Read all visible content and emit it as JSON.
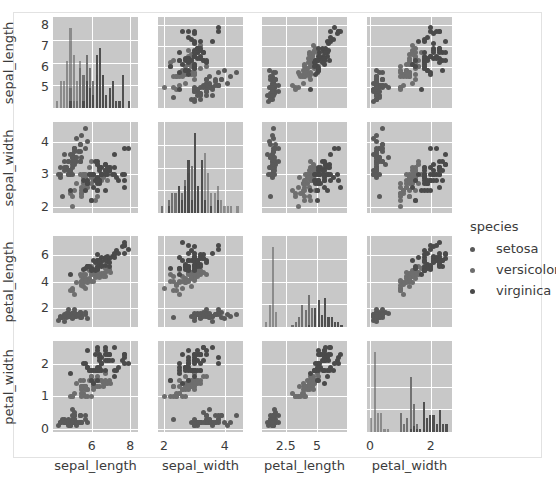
{
  "figure": {
    "title": "",
    "background": "#ffffff",
    "frame_color": "#e2e2e2",
    "panel_background": "#c8c8c8",
    "gridline_color": "#ffffff"
  },
  "legend": {
    "title": "species",
    "position": "right",
    "entries": [
      {
        "label": "setosa",
        "color": "#5a5a5a"
      },
      {
        "label": "versicolor",
        "color": "#6e6e6e"
      },
      {
        "label": "virginica",
        "color": "#4a4a4a"
      }
    ]
  },
  "chart_data": {
    "type": "scatter",
    "title": "",
    "subtitle": "",
    "plot_kind": "pairplot-matrix",
    "grid": true,
    "legend_position": "right",
    "variables": [
      "sepal_length",
      "sepal_width",
      "petal_length",
      "petal_width"
    ],
    "axis_labels": {
      "x": [
        "sepal_length",
        "sepal_width",
        "petal_length",
        "petal_width"
      ],
      "y": [
        "sepal_length",
        "sepal_width",
        "petal_length",
        "petal_width"
      ]
    },
    "ticks": {
      "sepal_length": {
        "values": [
          6,
          8
        ],
        "y_values": [
          5,
          6,
          7,
          8
        ],
        "lim": [
          4.0,
          8.4
        ]
      },
      "sepal_width": {
        "values": [
          2,
          4
        ],
        "y_values": [
          2,
          3,
          4
        ],
        "lim": [
          1.8,
          4.6
        ]
      },
      "petal_length": {
        "values": [
          2.5,
          5.0
        ],
        "y_values": [
          2,
          4,
          6
        ],
        "lim": [
          0.6,
          7.4
        ]
      },
      "petal_width": {
        "values": [
          0,
          2
        ],
        "y_values": [
          0,
          1,
          2
        ],
        "lim": [
          -0.1,
          2.7
        ]
      }
    },
    "diagonal": "histogram",
    "groups": [
      "setosa",
      "versicolor",
      "virginica"
    ],
    "group_colors": [
      "#5a5a5a",
      "#6e6e6e",
      "#4a4a4a"
    ],
    "series": [
      {
        "name": "setosa",
        "color": "#5a5a5a",
        "sepal_length": [
          5.1,
          4.9,
          4.7,
          4.6,
          5.0,
          5.4,
          4.6,
          5.0,
          4.4,
          4.9,
          5.4,
          4.8,
          4.8,
          4.3,
          5.8,
          5.7,
          5.4,
          5.1,
          5.7,
          5.1,
          5.4,
          5.1,
          4.6,
          5.1,
          4.8,
          5.0,
          5.0,
          5.2,
          5.2,
          4.7,
          4.8,
          5.4,
          5.2,
          5.5,
          4.9,
          5.0,
          5.5,
          4.9,
          4.4,
          5.1,
          5.0,
          4.5,
          4.4,
          5.0,
          5.1,
          4.8,
          5.1,
          4.6,
          5.3,
          5.0
        ],
        "sepal_width": [
          3.5,
          3.0,
          3.2,
          3.1,
          3.6,
          3.9,
          3.4,
          3.4,
          2.9,
          3.1,
          3.7,
          3.4,
          3.0,
          3.0,
          4.0,
          4.4,
          3.9,
          3.5,
          3.8,
          3.8,
          3.4,
          3.7,
          3.6,
          3.3,
          3.4,
          3.0,
          3.4,
          3.5,
          3.4,
          3.2,
          3.1,
          3.4,
          4.1,
          4.2,
          3.1,
          3.2,
          3.5,
          3.6,
          3.0,
          3.4,
          3.5,
          2.3,
          3.2,
          3.5,
          3.8,
          3.0,
          3.8,
          3.2,
          3.7,
          3.3
        ],
        "petal_length": [
          1.4,
          1.4,
          1.3,
          1.5,
          1.4,
          1.7,
          1.4,
          1.5,
          1.4,
          1.5,
          1.5,
          1.6,
          1.4,
          1.1,
          1.2,
          1.5,
          1.3,
          1.4,
          1.7,
          1.5,
          1.7,
          1.5,
          1.0,
          1.7,
          1.9,
          1.6,
          1.6,
          1.5,
          1.4,
          1.6,
          1.6,
          1.5,
          1.5,
          1.4,
          1.5,
          1.2,
          1.3,
          1.4,
          1.3,
          1.5,
          1.3,
          1.3,
          1.3,
          1.6,
          1.9,
          1.4,
          1.6,
          1.4,
          1.5,
          1.4
        ],
        "petal_width": [
          0.2,
          0.2,
          0.2,
          0.2,
          0.2,
          0.4,
          0.3,
          0.2,
          0.2,
          0.1,
          0.2,
          0.2,
          0.1,
          0.1,
          0.2,
          0.4,
          0.4,
          0.3,
          0.3,
          0.3,
          0.2,
          0.4,
          0.2,
          0.5,
          0.2,
          0.2,
          0.4,
          0.2,
          0.2,
          0.2,
          0.2,
          0.4,
          0.1,
          0.2,
          0.2,
          0.2,
          0.2,
          0.1,
          0.2,
          0.2,
          0.3,
          0.3,
          0.2,
          0.6,
          0.4,
          0.3,
          0.2,
          0.2,
          0.2,
          0.2
        ]
      },
      {
        "name": "versicolor",
        "color": "#6e6e6e",
        "sepal_length": [
          7.0,
          6.4,
          6.9,
          5.5,
          6.5,
          5.7,
          6.3,
          4.9,
          6.6,
          5.2,
          5.0,
          5.9,
          6.0,
          6.1,
          5.6,
          6.7,
          5.6,
          5.8,
          6.2,
          5.6,
          5.9,
          6.1,
          6.3,
          6.1,
          6.4,
          6.6,
          6.8,
          6.7,
          6.0,
          5.7,
          5.5,
          5.5,
          5.8,
          6.0,
          5.4,
          6.0,
          6.7,
          6.3,
          5.6,
          5.5,
          5.5,
          6.1,
          5.8,
          5.0,
          5.6,
          5.7,
          5.7,
          6.2,
          5.1,
          5.7
        ],
        "sepal_width": [
          3.2,
          3.2,
          3.1,
          2.3,
          2.8,
          2.8,
          3.3,
          2.4,
          2.9,
          2.7,
          2.0,
          3.0,
          2.2,
          2.9,
          2.9,
          3.1,
          3.0,
          2.7,
          2.2,
          2.5,
          3.2,
          2.8,
          2.5,
          2.8,
          2.9,
          3.0,
          2.8,
          3.0,
          2.9,
          2.6,
          2.4,
          2.4,
          2.7,
          2.7,
          3.0,
          3.4,
          3.1,
          2.3,
          3.0,
          2.5,
          2.6,
          3.0,
          2.6,
          2.3,
          2.7,
          3.0,
          2.9,
          2.9,
          2.5,
          2.8
        ],
        "petal_length": [
          4.7,
          4.5,
          4.9,
          4.0,
          4.6,
          4.5,
          4.7,
          3.3,
          4.6,
          3.9,
          3.5,
          4.2,
          4.0,
          4.7,
          3.6,
          4.4,
          4.5,
          4.1,
          4.5,
          3.9,
          4.8,
          4.0,
          4.9,
          4.7,
          4.3,
          4.4,
          4.8,
          5.0,
          4.5,
          3.5,
          3.8,
          3.7,
          3.9,
          5.1,
          4.5,
          4.5,
          4.7,
          4.4,
          4.1,
          4.0,
          4.4,
          4.6,
          4.0,
          3.3,
          4.2,
          4.2,
          4.2,
          4.3,
          3.0,
          4.1
        ],
        "petal_width": [
          1.4,
          1.5,
          1.5,
          1.3,
          1.5,
          1.3,
          1.6,
          1.0,
          1.3,
          1.4,
          1.0,
          1.5,
          1.0,
          1.4,
          1.3,
          1.4,
          1.5,
          1.0,
          1.5,
          1.1,
          1.8,
          1.3,
          1.5,
          1.2,
          1.3,
          1.4,
          1.4,
          1.7,
          1.5,
          1.0,
          1.1,
          1.0,
          1.2,
          1.6,
          1.5,
          1.6,
          1.5,
          1.3,
          1.3,
          1.3,
          1.2,
          1.4,
          1.2,
          1.0,
          1.3,
          1.2,
          1.3,
          1.3,
          1.1,
          1.3
        ]
      },
      {
        "name": "virginica",
        "color": "#4a4a4a",
        "sepal_length": [
          6.3,
          5.8,
          7.1,
          6.3,
          6.5,
          7.6,
          4.9,
          7.3,
          6.7,
          7.2,
          6.5,
          6.4,
          6.8,
          5.7,
          5.8,
          6.4,
          6.5,
          7.7,
          7.7,
          6.0,
          6.9,
          5.6,
          7.7,
          6.3,
          6.7,
          7.2,
          6.2,
          6.1,
          6.4,
          7.2,
          7.4,
          7.9,
          6.4,
          6.3,
          6.1,
          7.7,
          6.3,
          6.4,
          6.0,
          6.9,
          6.7,
          6.9,
          5.8,
          6.8,
          6.7,
          6.7,
          6.3,
          6.5,
          6.2,
          5.9
        ],
        "sepal_width": [
          3.3,
          2.7,
          3.0,
          2.9,
          3.0,
          3.0,
          2.5,
          2.9,
          2.5,
          3.6,
          3.2,
          2.7,
          3.0,
          2.5,
          2.8,
          3.2,
          3.0,
          3.8,
          2.6,
          2.2,
          3.2,
          2.8,
          2.8,
          2.7,
          3.3,
          3.2,
          2.8,
          3.0,
          2.8,
          3.0,
          2.8,
          3.8,
          2.8,
          2.8,
          2.6,
          3.0,
          3.4,
          3.1,
          3.0,
          3.1,
          3.1,
          3.1,
          2.7,
          3.2,
          3.3,
          3.0,
          2.5,
          3.0,
          3.4,
          3.0
        ],
        "petal_length": [
          6.0,
          5.1,
          5.9,
          5.6,
          5.8,
          6.6,
          4.5,
          6.3,
          5.8,
          6.1,
          5.1,
          5.3,
          5.5,
          5.0,
          5.1,
          5.3,
          5.5,
          6.7,
          6.9,
          5.0,
          5.7,
          4.9,
          6.7,
          4.9,
          5.7,
          6.0,
          4.8,
          4.9,
          5.6,
          5.8,
          6.1,
          6.4,
          5.6,
          5.1,
          5.6,
          6.1,
          5.6,
          5.5,
          4.8,
          5.4,
          5.6,
          5.1,
          5.1,
          5.9,
          5.7,
          5.2,
          5.0,
          5.2,
          5.4,
          5.1
        ],
        "petal_width": [
          2.5,
          1.9,
          2.1,
          1.8,
          2.2,
          2.1,
          1.7,
          1.8,
          1.8,
          2.5,
          2.0,
          1.9,
          2.1,
          2.0,
          2.4,
          2.3,
          1.8,
          2.2,
          2.3,
          1.5,
          2.3,
          2.0,
          2.0,
          1.8,
          2.1,
          1.8,
          1.8,
          1.8,
          2.1,
          1.6,
          1.9,
          2.0,
          2.2,
          1.5,
          1.4,
          2.3,
          2.4,
          1.8,
          1.8,
          2.1,
          2.4,
          2.3,
          1.9,
          2.3,
          2.5,
          2.3,
          1.9,
          2.0,
          2.3,
          1.8
        ]
      }
    ]
  }
}
